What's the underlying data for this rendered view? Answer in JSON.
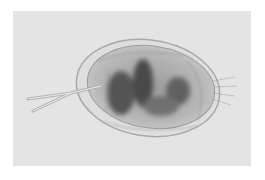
{
  "image": {
    "description": "Microscope photograph of a small transparent crustacean (cladoceran/ostracod) with an oval carapace, dark internal gut mass, and a forked tail extending to the left, on a light grey background",
    "background_color": "#e4e4e4",
    "page_color": "#ffffff",
    "subject_colors": {
      "carapace_edge": "#a9a9a9",
      "body_fill": "#bdbdbd",
      "dark_mass": "#4a4a4a"
    }
  }
}
